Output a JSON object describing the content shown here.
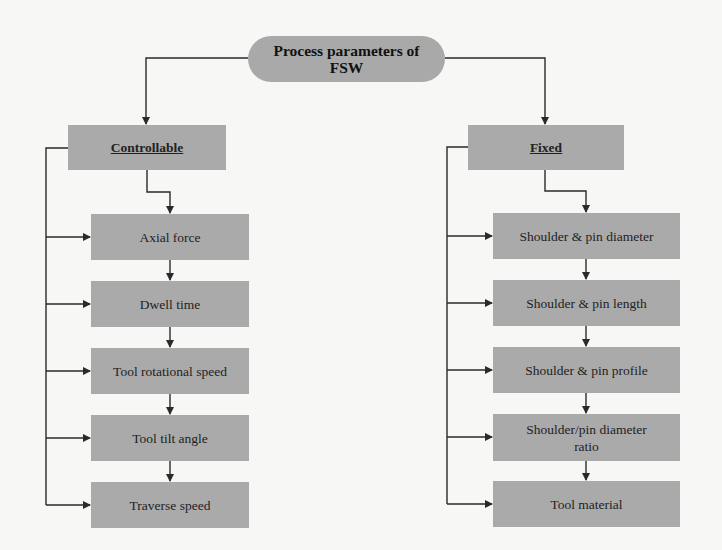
{
  "diagram": {
    "title": "Process parameters of FSW",
    "title_lines": [
      "Process parameters of",
      "FSW"
    ],
    "branches": [
      {
        "label": "Controllable",
        "items": [
          "Axial force",
          "Dwell time",
          "Tool rotational speed",
          "Tool tilt angle",
          "Traverse speed"
        ]
      },
      {
        "label": "Fixed",
        "items": [
          "Shoulder & pin diameter",
          "Shoulder & pin length",
          "Shoulder & pin profile",
          "Shoulder/pin diameter ratio",
          "Tool material"
        ]
      }
    ],
    "colors": {
      "node_fill": "#aaaaaa",
      "root_fill": "#a9a9a9",
      "connector": "#2a2a2a",
      "background": "#f7f7f5"
    }
  }
}
